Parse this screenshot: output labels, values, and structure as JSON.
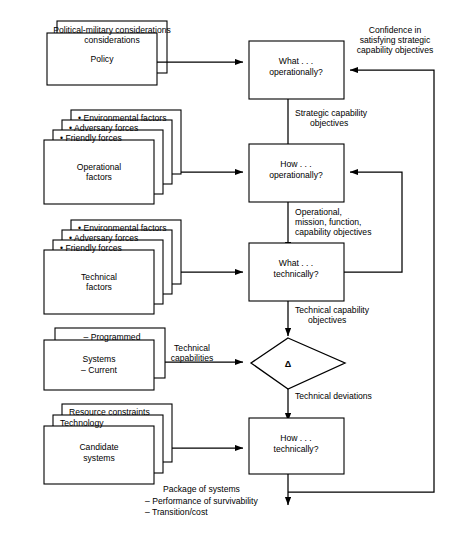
{
  "diagram": {
    "colors": {
      "line": "#000000",
      "box_fill": "#ffffff",
      "background": "#ffffff"
    },
    "input_stacks": [
      {
        "name": "policy-stack",
        "layers": [
          "Political-military considerations"
        ],
        "front_lines": [
          "Policy"
        ]
      },
      {
        "name": "operational-factors-stack",
        "layers": [
          "• Environmental factors",
          "• Adversary forces",
          "• Friendly forces"
        ],
        "front_lines": [
          "Operational",
          "factors"
        ]
      },
      {
        "name": "technical-factors-stack",
        "layers": [
          "• Environmental factors",
          "• Adversary forces",
          "• Friendly forces"
        ],
        "front_lines": [
          "Technical",
          "factors"
        ]
      },
      {
        "name": "systems-stack",
        "layers": [
          "– Programmed"
        ],
        "front_lines": [
          "Systems",
          "– Current"
        ]
      },
      {
        "name": "candidate-systems-stack",
        "layers": [
          "Resource constraints",
          "Technology"
        ],
        "front_lines": [
          "Candidate",
          "systems"
        ]
      }
    ],
    "process_nodes": [
      {
        "name": "what-operationally",
        "lines": [
          "What . . .",
          "operationally?"
        ]
      },
      {
        "name": "how-operationally",
        "lines": [
          "How . . .",
          "operationally?"
        ]
      },
      {
        "name": "what-technically",
        "lines": [
          "What . . .",
          "technically?"
        ]
      },
      {
        "name": "how-technically",
        "lines": [
          "How . . .",
          "technically?"
        ]
      }
    ],
    "decision_node": {
      "name": "delta-comparison",
      "symbol": "Δ"
    },
    "edge_labels": {
      "strategic_capability_objectives": [
        "Strategic capability",
        "objectives"
      ],
      "operational_mission_function": [
        "Operational,",
        "mission, function,",
        "capability objectives"
      ],
      "technical_capability_objectives": [
        "Technical capability",
        "objectives"
      ],
      "technical_capabilities": [
        "Technical",
        "capabilities"
      ],
      "technical_deviations": [
        "Technical deviations"
      ],
      "confidence_feedback": [
        "Confidence in",
        "satisfying strategic",
        "capability objectives"
      ]
    },
    "output_block": {
      "name": "package-of-systems",
      "heading": "Package of systems",
      "items": [
        "– Performance of survivability",
        "– Transition/cost"
      ]
    }
  }
}
